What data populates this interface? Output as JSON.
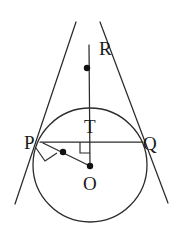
{
  "figure": {
    "type": "geometry-diagram",
    "width": 186,
    "height": 238,
    "background_color": "#ffffff",
    "stroke_color": "#2b2b2b",
    "label_color": "#1a1a1a"
  },
  "circle": {
    "name": "main-circle",
    "center_x": 90,
    "center_y": 165,
    "radius": 57
  },
  "labels": {
    "R": "R",
    "P": "P",
    "Q": "Q",
    "T": "T",
    "O": "O"
  },
  "label_positions": {
    "R": {
      "x": 99,
      "y": 55
    },
    "P": {
      "x": 24,
      "y": 149
    },
    "Q": {
      "x": 143,
      "y": 150
    },
    "T": {
      "x": 84,
      "y": 133
    },
    "O": {
      "x": 83,
      "y": 190
    }
  },
  "points": {
    "R": {
      "x": 89,
      "y": 45
    },
    "P": {
      "x": 43,
      "y": 142
    },
    "Q": {
      "x": 140,
      "y": 142
    },
    "T": {
      "x": 90,
      "y": 142
    },
    "O": {
      "x": 90,
      "y": 165
    }
  },
  "segments": [
    {
      "name": "tangent-through-P",
      "x1": 76,
      "y1": 22,
      "x2": 15,
      "y2": 204
    },
    {
      "name": "tangent-through-Q",
      "x1": 100,
      "y1": 22,
      "x2": 168,
      "y2": 203
    },
    {
      "name": "line-R-to-O",
      "x1": 89,
      "y1": 45,
      "x2": 90,
      "y2": 166
    },
    {
      "name": "chord-P-to-Q",
      "x1": 40,
      "y1": 142,
      "x2": 143,
      "y2": 142
    },
    {
      "name": "radius-P-to-O",
      "x1": 43,
      "y1": 143,
      "x2": 90,
      "y2": 166
    }
  ],
  "right_angle_marks": [
    {
      "name": "right-angle-at-P",
      "path": "M 36 148 L 45 161 L 57 153"
    },
    {
      "name": "right-angle-at-T",
      "path": "M 80 142 L 80 153 L 90 153"
    }
  ],
  "dots": [
    {
      "name": "dot-on-segment-RT",
      "x": 87,
      "y": 68,
      "r": 3.2
    },
    {
      "name": "dot-on-segment-PO",
      "x": 63,
      "y": 152,
      "r": 3.2
    },
    {
      "name": "dot-at-centre-O",
      "x": 90,
      "y": 166,
      "r": 3.2
    }
  ]
}
